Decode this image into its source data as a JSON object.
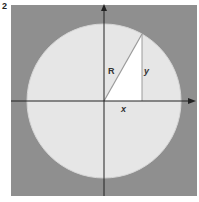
{
  "figure": {
    "number": "2",
    "labels": {
      "hypotenuse": "R",
      "vertical_leg": "y",
      "horizontal_leg": "x"
    },
    "colors": {
      "background_square": "#8f8f8f",
      "circle_fill": "#e6e6e6",
      "triangle_fill": "#ffffff",
      "axes": "#222222"
    }
  }
}
